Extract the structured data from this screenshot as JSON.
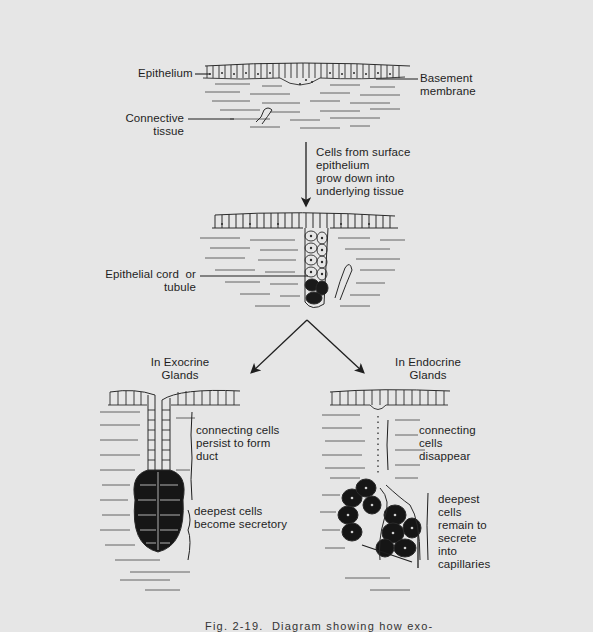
{
  "figure": {
    "caption": "Fig. 2-19.  Diagram showing how exo-",
    "stages": {
      "initial": {
        "labels": {
          "epithelium": "Epithelium",
          "basement_membrane": "Basement\nmembrane",
          "connective_tissue": "Connective\ntissue"
        }
      },
      "transition": {
        "description": "Cells from surface\nepithelium\ngrow down into\nunderlying tissue"
      },
      "cord": {
        "labels": {
          "epithelial_cord": "Epithelial cord  or\ntubule"
        }
      },
      "exocrine": {
        "title": "In Exocrine\nGlands",
        "duct_note": "connecting cells\npersist to form\nduct",
        "secretory_note": "deepest cells\nbecome secretory"
      },
      "endocrine": {
        "title": "In Endocrine\nGlands",
        "connecting_note": "connecting\ncells\ndisappear",
        "secretory_note": "deepest\ncells\nremain to\nsecrete\ninto\ncapillaries"
      }
    },
    "colors": {
      "background": "#e6e6e6",
      "ink": "#1f1f1f",
      "secretory_fill": "#161616"
    }
  }
}
